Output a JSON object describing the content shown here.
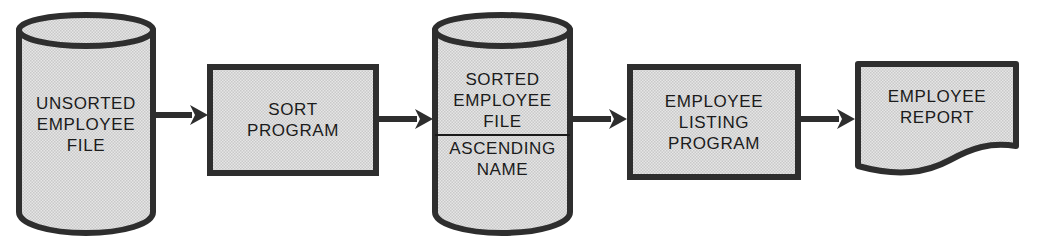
{
  "diagram": {
    "style": {
      "fill": "#dcdcdc",
      "stroke": "#2e2e2e",
      "text": "#1b1b1b",
      "background": "#ffffff"
    },
    "nodes": [
      {
        "id": "unsorted-employee-file",
        "shape": "cylinder",
        "name": "unsorted-employee-file-node",
        "lines": [
          "UNSORTED",
          "EMPLOYEE",
          "FILE"
        ],
        "qualifier": []
      },
      {
        "id": "sort-program",
        "shape": "process",
        "name": "sort-program-node",
        "lines": [
          "SORT",
          "PROGRAM"
        ],
        "qualifier": []
      },
      {
        "id": "sorted-employee-file",
        "shape": "cylinder",
        "name": "sorted-employee-file-node",
        "lines": [
          "SORTED",
          "EMPLOYEE",
          "FILE"
        ],
        "qualifier": [
          "ASCENDING",
          "NAME"
        ]
      },
      {
        "id": "employee-listing-program",
        "shape": "process",
        "name": "employee-listing-program-node",
        "lines": [
          "EMPLOYEE",
          "LISTING",
          "PROGRAM"
        ],
        "qualifier": []
      },
      {
        "id": "employee-report",
        "shape": "document",
        "name": "employee-report-node",
        "lines": [
          "EMPLOYEE",
          "REPORT"
        ],
        "qualifier": []
      }
    ],
    "connectors": [
      {
        "id": "arrow-1",
        "from": "unsorted-employee-file",
        "to": "sort-program"
      },
      {
        "id": "arrow-2",
        "from": "sort-program",
        "to": "sorted-employee-file"
      },
      {
        "id": "arrow-3",
        "from": "sorted-employee-file",
        "to": "employee-listing-program"
      },
      {
        "id": "arrow-4",
        "from": "employee-listing-program",
        "to": "employee-report"
      }
    ]
  }
}
